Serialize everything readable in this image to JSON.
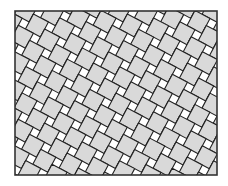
{
  "figure": {
    "title": "",
    "colors": {
      "background": "#ffffff",
      "large_tile": "#d9d9d9",
      "small_tile": "#ffffff",
      "lines": "#222222",
      "frame": "#333333"
    },
    "frame": {
      "x": 15,
      "y": 11,
      "width": 202,
      "height": 164
    },
    "tiling": {
      "type": "pythagorean",
      "large_square_size": 17,
      "small_square_size": 8,
      "rotation_deg": 28
    }
  }
}
